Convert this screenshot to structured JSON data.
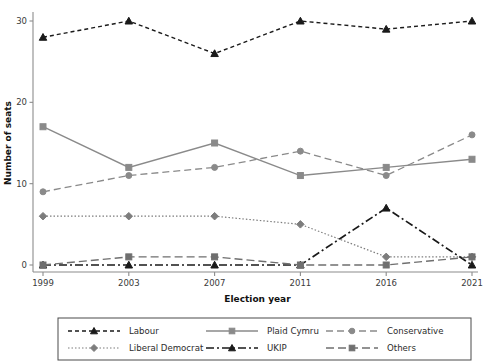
{
  "chart_data": {
    "type": "line",
    "title": "",
    "xlabel": "Election year",
    "ylabel": "Number of seats",
    "categories": [
      "1999",
      "2003",
      "2007",
      "2011",
      "2016",
      "2021"
    ],
    "x_tick_labels": [
      "1999",
      "2003",
      "2007",
      "2011",
      "2016",
      "2021"
    ],
    "y_tick_labels": [
      "0",
      "10",
      "20",
      "30"
    ],
    "y_ticks": [
      0,
      10,
      20,
      30
    ],
    "ylim": [
      0,
      31
    ],
    "grid": false,
    "legend_position": "bottom-outside",
    "legend_columns": 3,
    "legend_rows": 2,
    "series": [
      {
        "name": "Labour",
        "values": [
          28,
          30,
          26,
          30,
          29,
          30
        ],
        "color": "#1a1a1a",
        "marker": "triangle",
        "dash": "4,3",
        "width": 1.4
      },
      {
        "name": "Plaid Cymru",
        "values": [
          17,
          12,
          15,
          11,
          12,
          13
        ],
        "color": "#8a8a8a",
        "marker": "square",
        "dash": "none",
        "width": 1.4
      },
      {
        "name": "Conservative",
        "values": [
          9,
          11,
          12,
          14,
          11,
          16
        ],
        "color": "#8a8a8a",
        "marker": "circle",
        "dash": "7,4",
        "width": 1.3
      },
      {
        "name": "Liberal Democrat",
        "values": [
          6,
          6,
          6,
          5,
          1,
          1
        ],
        "color": "#7d7d7d",
        "marker": "diamond",
        "dash": "1.5,2",
        "width": 1.2
      },
      {
        "name": "UKIP",
        "values": [
          0,
          0,
          0,
          0,
          7,
          0
        ],
        "color": "#1a1a1a",
        "marker": "triangle",
        "dash": "8,3,2,3",
        "width": 1.7
      },
      {
        "name": "Others",
        "values": [
          0,
          1,
          1,
          0,
          0,
          1
        ],
        "color": "#6f6f6f",
        "marker": "square",
        "dash": "8,4",
        "width": 1.4
      }
    ],
    "legend_entries": [
      {
        "label": "Labour",
        "color": "#1a1a1a",
        "marker": "triangle",
        "dash": "4,3",
        "width": 1.4
      },
      {
        "label": "Plaid Cymru",
        "color": "#8a8a8a",
        "marker": "square",
        "dash": "none",
        "width": 1.4
      },
      {
        "label": "Conservative",
        "color": "#8a8a8a",
        "marker": "circle",
        "dash": "7,4",
        "width": 1.3
      },
      {
        "label": "Liberal Democrat",
        "color": "#7d7d7d",
        "marker": "diamond",
        "dash": "1.5,2",
        "width": 1.2
      },
      {
        "label": "UKIP",
        "color": "#1a1a1a",
        "marker": "triangle",
        "dash": "8,3,2,3",
        "width": 1.7
      },
      {
        "label": "Others",
        "color": "#6f6f6f",
        "marker": "square",
        "dash": "8,4",
        "width": 1.4
      }
    ]
  },
  "colors": {
    "background": "#ffffff",
    "axis": "#8c8c8c",
    "text": "#1a1a1a",
    "legend_border": "#4a4a4a"
  }
}
